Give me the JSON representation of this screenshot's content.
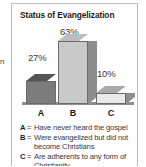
{
  "page_bleed_text": "n",
  "figure": {
    "title": "Status of Evangelization",
    "categories": {
      "a": "A",
      "b": "B",
      "c": "C"
    },
    "value_labels": {
      "a": "27%",
      "b": "63%",
      "c": "10%"
    },
    "legend": [
      {
        "key": "A",
        "eq": "=",
        "text": "Have never heard the gospel"
      },
      {
        "key": "B",
        "eq": "=",
        "text": "Were evangelized but did not become Christians"
      },
      {
        "key": "C",
        "eq": "=",
        "text": "Are adherents to any form of Christianity"
      }
    ],
    "colors": {
      "bar_a_front": "#7c7c7c",
      "bar_b_front": "#c9c9c9",
      "bar_c_front": "#e9e9e9",
      "border": "#b9bcc0",
      "text": "#3a3a3a"
    }
  },
  "chart_data": {
    "type": "bar",
    "title": "Status of Evangelization",
    "categories": [
      "A",
      "B",
      "C"
    ],
    "values": [
      27,
      63,
      10
    ],
    "value_labels": [
      "27%",
      "63%",
      "10%"
    ],
    "category_descriptions": [
      "Have never heard the gospel",
      "Were evangelized but did not become Christians",
      "Are adherents to any form of Christianity"
    ],
    "units": "percent",
    "xlabel": "",
    "ylabel": "",
    "ylim": [
      0,
      70
    ],
    "grid": false,
    "legend_position": "below",
    "style": "3d-bars"
  }
}
